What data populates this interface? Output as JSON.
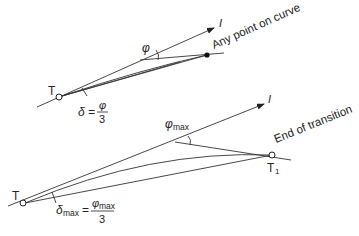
{
  "diagram": {
    "colors": {
      "line": "#333333",
      "text": "#222222",
      "background": "#ffffff"
    },
    "top_figure": {
      "start_point_label": "T",
      "tangent_label": "I",
      "angle_label": "φ",
      "point_annotation": "Any point on curve",
      "deflection_lhs": "δ =",
      "deflection_numerator": "φ",
      "deflection_denominator": "3"
    },
    "bottom_figure": {
      "start_point_label": "T",
      "tangent_label": "I",
      "angle_label_base": "φ",
      "angle_label_sub": "max",
      "end_point_label_base": "T",
      "end_point_label_sub": "1",
      "end_annotation": "End of transition",
      "deflection_lhs_base": "δ",
      "deflection_lhs_sub": "max",
      "deflection_equals": "=",
      "deflection_numerator_base": "φ",
      "deflection_numerator_sub": "max",
      "deflection_denominator": "3"
    }
  }
}
